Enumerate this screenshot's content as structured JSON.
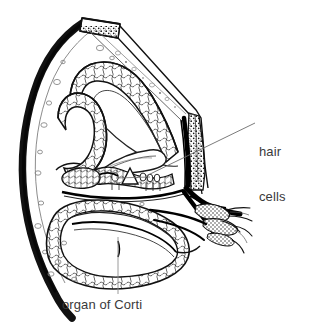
{
  "figure": {
    "background_color": "#ffffff",
    "ink_color": "#1a1a1a",
    "label_color": "#3a3a3a",
    "width": 313,
    "height": 331
  },
  "labels": {
    "hair_cells": {
      "line1": "hair",
      "line2": "cells",
      "full": "hair cells"
    },
    "organ_of_corti": {
      "text": "organ of Corti"
    }
  },
  "leaders": {
    "hair_cells_leader": "diagonal line from label left edge to organ of Corti hair cell region",
    "organ_of_corti_leader": "vertical line from label up to basilar membrane"
  },
  "structures": [
    {
      "name": "outer-bony-wall",
      "description": "thick dark bone capsule on left"
    },
    {
      "name": "top-bone-cap",
      "description": "cut bone segment at top"
    },
    {
      "name": "scala-vestibuli",
      "description": "upper fluid chamber"
    },
    {
      "name": "reissners-membrane",
      "description": "thin diagonal membrane"
    },
    {
      "name": "scala-media",
      "description": "middle cochlear duct chamber"
    },
    {
      "name": "stria-vascularis",
      "description": "dark stippled band on right wall"
    },
    {
      "name": "organ-of-corti",
      "description": "sensory epithelium on basilar membrane"
    },
    {
      "name": "tectorial-membrane",
      "description": "flap over hair cells"
    },
    {
      "name": "basilar-membrane",
      "description": "membrane beneath organ of Corti"
    },
    {
      "name": "scala-tympani",
      "description": "lower fluid chamber"
    },
    {
      "name": "spiral-ganglion",
      "description": "nerve cell bodies lower right"
    },
    {
      "name": "cochlear-nerve-fibers",
      "description": "radiating nerve fibers right"
    },
    {
      "name": "spiral-limbus",
      "description": "ridge left of organ of Corti"
    }
  ]
}
